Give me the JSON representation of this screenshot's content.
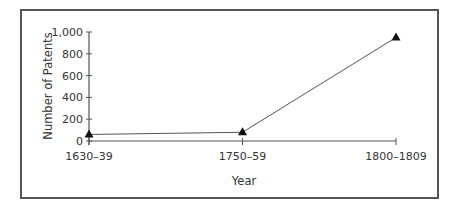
{
  "chart_data": {
    "type": "line",
    "title": "",
    "xlabel": "Year",
    "ylabel": "Number of Patents",
    "categories": [
      "1630–39",
      "1750–59",
      "1800–1809"
    ],
    "values": [
      60,
      80,
      950
    ],
    "series": [
      {
        "name": "Number of Patents",
        "values": [
          60,
          80,
          950
        ],
        "marker": "triangle"
      }
    ],
    "yticks": [
      "0",
      "200",
      "400",
      "600",
      "800",
      "1,000"
    ],
    "ylim": [
      0,
      1000
    ],
    "grid": false,
    "legend": null
  },
  "colors": {
    "line": "#555555",
    "axis": "#555555",
    "marker": "#111111",
    "frame": "#555555",
    "text": "#333333"
  }
}
